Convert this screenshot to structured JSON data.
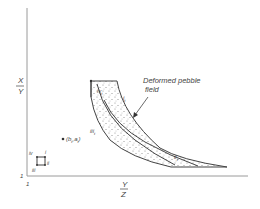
{
  "diagram": {
    "title": "Deformed pebble field",
    "annotation": {
      "line1": "Deformed  pebble",
      "line2": "field"
    },
    "axes": {
      "y_label_num": "X",
      "y_label_den": "Y",
      "x_label_num": "Y",
      "x_label_den": "Z",
      "origin_y_tick": "1",
      "origin_x_tick": "1"
    },
    "point": {
      "label": "(b",
      "sub1": "t",
      "mid": ",a",
      "sub2": "t",
      "close": ")"
    },
    "square_corners": {
      "i": "i",
      "ii": "ii",
      "iii": "iii",
      "iv": "iv"
    },
    "field_labels": {
      "i_t": "i",
      "ii_t": "ii",
      "iii_t": "iii",
      "iv_t": "iv",
      "sub": "t"
    },
    "colors": {
      "line": "#444444",
      "axis": "#9a9a9a",
      "stipple": "#777777"
    }
  }
}
